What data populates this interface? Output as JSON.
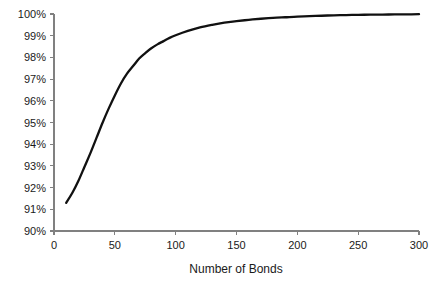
{
  "chart_data": {
    "type": "line",
    "title": "",
    "xlabel": "Number of Bonds",
    "ylabel": "",
    "xlim": [
      0,
      300
    ],
    "ylim": [
      90,
      100
    ],
    "grid": false,
    "legend": false,
    "x_ticks": [
      0,
      50,
      100,
      150,
      200,
      250,
      300
    ],
    "x_tick_labels": [
      "0",
      "50",
      "100",
      "150",
      "200",
      "250",
      "300"
    ],
    "y_ticks": [
      90,
      91,
      92,
      93,
      94,
      95,
      96,
      97,
      98,
      99,
      100
    ],
    "y_tick_labels": [
      "90%",
      "91%",
      "92%",
      "93%",
      "94%",
      "95%",
      "96%",
      "97%",
      "98%",
      "99%",
      "100%"
    ],
    "series": [
      {
        "name": "Diversification benefit",
        "color": "#111111",
        "x": [
          10,
          15,
          20,
          25,
          30,
          35,
          40,
          45,
          50,
          55,
          60,
          65,
          70,
          75,
          80,
          85,
          90,
          95,
          100,
          110,
          120,
          130,
          140,
          150,
          160,
          170,
          180,
          190,
          200,
          210,
          220,
          230,
          240,
          250,
          260,
          270,
          280,
          290,
          300
        ],
        "y": [
          91.3,
          91.75,
          92.3,
          92.95,
          93.6,
          94.3,
          95.0,
          95.65,
          96.25,
          96.8,
          97.25,
          97.6,
          97.95,
          98.2,
          98.42,
          98.6,
          98.75,
          98.9,
          99.02,
          99.22,
          99.38,
          99.5,
          99.6,
          99.67,
          99.73,
          99.78,
          99.82,
          99.85,
          99.88,
          99.9,
          99.92,
          99.94,
          99.95,
          99.96,
          99.97,
          99.975,
          99.98,
          99.985,
          99.99
        ]
      }
    ]
  },
  "axes": {
    "axis_color": "#808080",
    "tick_color": "#808080",
    "text_color": "#1a1a1a"
  }
}
